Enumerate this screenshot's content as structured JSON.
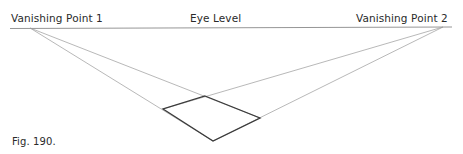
{
  "labels": {
    "vanishing_point_1": "Vanishing Point 1",
    "eye_level": "Eye Level",
    "vanishing_point_2": "Vanishing Point 2"
  },
  "caption": "Fig. 190.",
  "diagram": {
    "type": "two-point perspective",
    "horizon": {
      "x1": 10,
      "x2": 452,
      "y": 28
    },
    "vanishing_points": [
      {
        "name": "Vanishing Point 1",
        "x": 30,
        "y": 28
      },
      {
        "name": "Vanishing Point 2",
        "x": 443,
        "y": 27
      }
    ],
    "square_vertices": {
      "top": [
        205,
        96
      ],
      "left": [
        163,
        109
      ],
      "right": [
        260,
        118
      ],
      "bottom": [
        213,
        141
      ]
    },
    "colors": {
      "construction_line": "#9a9a9a",
      "square": "#3a3a3a",
      "horizon": "#8a8a8a"
    }
  }
}
